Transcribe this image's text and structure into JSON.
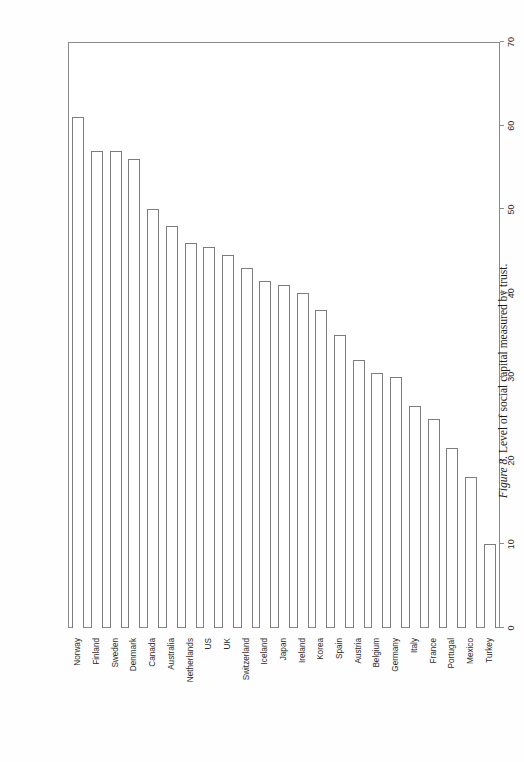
{
  "figure": {
    "caption_prefix": "Figure 8.",
    "caption_text": " Level of social capital measured by trust.",
    "orientation": "rotated-90-ccw",
    "page_background": "#ffffff"
  },
  "axis": {
    "value_axis_title": "A Measure of Trust",
    "value_ticks": [
      "0",
      "10",
      "20",
      "30",
      "40",
      "50",
      "60",
      "70"
    ],
    "value_min": 0,
    "value_max": 70,
    "tick_step": 10
  },
  "style": {
    "bar_fill": "#ffffff",
    "bar_stroke": "#7d7d7d",
    "frame_stroke": "#8a8a8a",
    "text_color": "#2a2a2a"
  },
  "chart_data": {
    "type": "bar",
    "title": "",
    "subtitle": "",
    "xlabel": "A Measure of Trust",
    "ylabel": "",
    "orientation": "horizontal",
    "grid": false,
    "legend": false,
    "legend_position": "none",
    "xlim": [
      0,
      70
    ],
    "categories": [
      "Norway",
      "Finland",
      "Sweden",
      "Denmark",
      "Canada",
      "Australia",
      "Netherlands",
      "US",
      "UK",
      "Switzerland",
      "Iceland",
      "Japan",
      "Ireland",
      "Korea",
      "Spain",
      "Austria",
      "Belgium",
      "Germany",
      "Italy",
      "France",
      "Portugal",
      "Mexico",
      "Turkey"
    ],
    "values": [
      61,
      57,
      57,
      56,
      50,
      48,
      46,
      45.5,
      44.5,
      43,
      41.5,
      41,
      40,
      38,
      35,
      32,
      30.5,
      30,
      26.5,
      25,
      21.5,
      18,
      10
    ],
    "series": [
      {
        "name": "A Measure of Trust",
        "values": [
          61,
          57,
          57,
          56,
          50,
          48,
          46,
          45.5,
          44.5,
          43,
          41.5,
          41,
          40,
          38,
          35,
          32,
          30.5,
          30,
          26.5,
          25,
          21.5,
          18,
          10
        ]
      }
    ]
  }
}
